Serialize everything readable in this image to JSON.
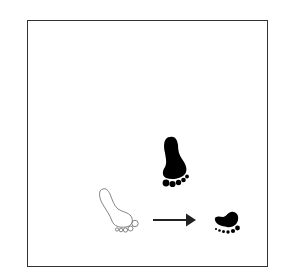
{
  "diagram": {
    "frame": {
      "border_color": "#333333",
      "background": "#ffffff"
    },
    "elements": [
      {
        "id": "large-black-footprint",
        "kind": "footprint",
        "style": "filled",
        "color": "#000000"
      },
      {
        "id": "outline-footprint",
        "kind": "footprint",
        "style": "outline",
        "color": "#777777"
      },
      {
        "id": "arrow",
        "kind": "arrow",
        "direction": "right",
        "color": "#222222"
      },
      {
        "id": "small-black-footprint",
        "kind": "footprint",
        "style": "filled",
        "color": "#000000"
      }
    ]
  }
}
